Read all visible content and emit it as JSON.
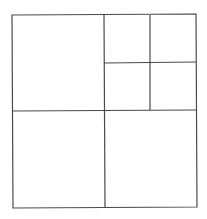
{
  "diagram": {
    "type": "square-subdivision",
    "stroke_color": "#4a4a4a",
    "background": "#ffffff",
    "outer": {
      "x1": 12,
      "y1": 15,
      "x2": 196,
      "y2": 207
    },
    "lines": [
      {
        "id": "vertical-main",
        "x1": 104,
        "y1": 15,
        "x2": 105,
        "y2": 207
      },
      {
        "id": "horizontal-main",
        "x1": 13,
        "y1": 111,
        "x2": 196,
        "y2": 110
      },
      {
        "id": "vertical-sub",
        "x1": 150,
        "y1": 15,
        "x2": 150,
        "y2": 110
      },
      {
        "id": "horizontal-sub",
        "x1": 104,
        "y1": 63,
        "x2": 196,
        "y2": 62
      }
    ],
    "regions": [
      {
        "name": "top-left-square"
      },
      {
        "name": "top-right-sub-top-left"
      },
      {
        "name": "top-right-sub-top-right"
      },
      {
        "name": "top-right-sub-bottom-left"
      },
      {
        "name": "top-right-sub-bottom-right"
      },
      {
        "name": "bottom-left-square"
      },
      {
        "name": "bottom-right-square"
      }
    ]
  }
}
